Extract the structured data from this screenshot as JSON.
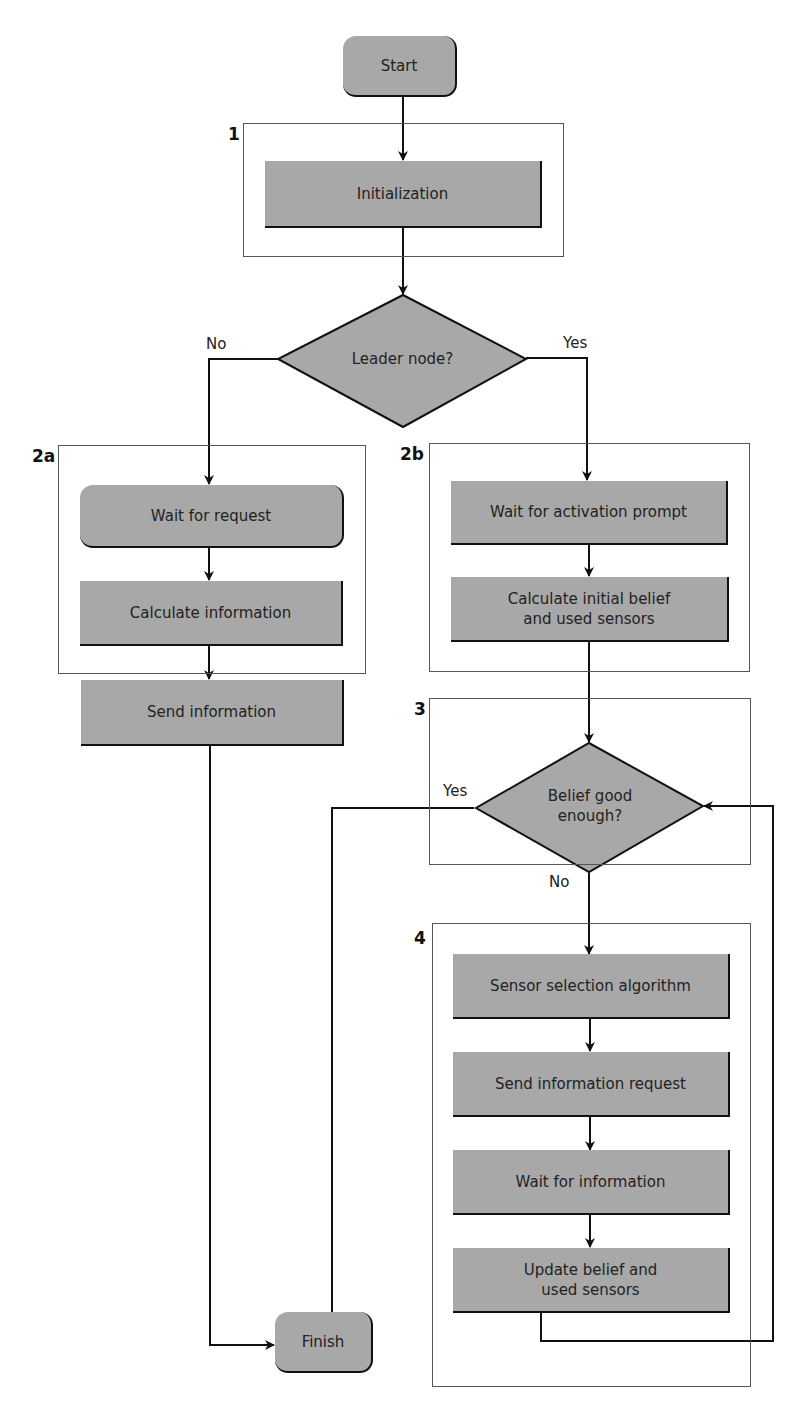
{
  "diagram": {
    "type": "flowchart",
    "colors": {
      "node_fill": "#a8a8a8",
      "line": "#111111",
      "group_border": "#555555",
      "background": "#ffffff"
    },
    "terminals": {
      "start": "Start",
      "finish": "Finish"
    },
    "groups": {
      "g1": {
        "label": "1",
        "nodes": {
          "init": "Initialization"
        }
      },
      "g2a": {
        "label": "2a",
        "nodes": {
          "wait_request": "Wait for request",
          "calc_info": "Calculate information",
          "send_info": "Send information"
        }
      },
      "g2b": {
        "label": "2b",
        "nodes": {
          "wait_activation": "Wait for activation prompt",
          "calc_initial_l1": "Calculate initial belief",
          "calc_initial_l2": "and used sensors"
        }
      },
      "g3": {
        "label": "3",
        "nodes": {
          "belief_good_l1": "Belief good",
          "belief_good_l2": "enough?"
        }
      },
      "g4": {
        "label": "4",
        "nodes": {
          "sensor_select": "Sensor selection algorithm",
          "send_request": "Send information request",
          "wait_info": "Wait for information",
          "update_l1": "Update belief and",
          "update_l2": "used sensors"
        }
      }
    },
    "decisions": {
      "leader": "Leader node?"
    },
    "edge_labels": {
      "leader_no": "No",
      "leader_yes": "Yes",
      "belief_yes": "Yes",
      "belief_no": "No"
    },
    "edges": [
      [
        "Start",
        "Initialization"
      ],
      [
        "Initialization",
        "Leader node?"
      ],
      [
        "Leader node?",
        "Wait for request",
        "No"
      ],
      [
        "Leader node?",
        "Wait for activation prompt",
        "Yes"
      ],
      [
        "Wait for request",
        "Calculate information"
      ],
      [
        "Calculate information",
        "Send information"
      ],
      [
        "Send information",
        "Finish"
      ],
      [
        "Wait for activation prompt",
        "Calculate initial belief and used sensors"
      ],
      [
        "Calculate initial belief and used sensors",
        "Belief good enough?"
      ],
      [
        "Belief good enough?",
        "Finish",
        "Yes"
      ],
      [
        "Belief good enough?",
        "Sensor selection algorithm",
        "No"
      ],
      [
        "Sensor selection algorithm",
        "Send information request"
      ],
      [
        "Send information request",
        "Wait for information"
      ],
      [
        "Wait for information",
        "Update belief and used sensors"
      ],
      [
        "Update belief and used sensors",
        "Belief good enough?"
      ]
    ]
  }
}
